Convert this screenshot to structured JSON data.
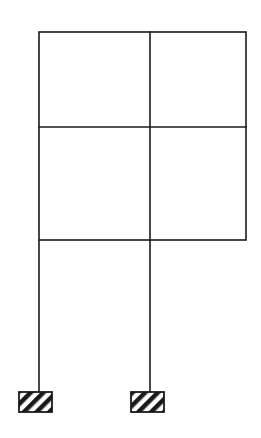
{
  "diagram": {
    "type": "structural-frame",
    "stroke_color": "#1a1a1a",
    "background_color": "#ffffff",
    "frame": {
      "x_left": 39,
      "x_mid": 150,
      "x_right": 246,
      "y_top": 32,
      "y_mid": 127,
      "y_bottom": 240
    },
    "columns": [
      {
        "x": 39,
        "y_top": 240,
        "y_bottom": 392
      },
      {
        "x": 150,
        "y_top": 240,
        "y_bottom": 392
      }
    ],
    "supports": [
      {
        "type": "fixed-hatched",
        "x": 19,
        "y": 392,
        "width": 33,
        "height": 20
      },
      {
        "type": "fixed-hatched",
        "x": 131,
        "y": 392,
        "width": 33,
        "height": 20
      }
    ],
    "bays": 2,
    "storeys": 2
  }
}
